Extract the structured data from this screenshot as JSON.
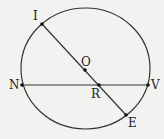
{
  "diagram": {
    "type": "circle-geometry",
    "stroke_color": "#333333",
    "background": "#f2f2f0",
    "circle": {
      "cx": 85.5,
      "cy": 68.5,
      "rx": 64.5,
      "ry": 60.5
    },
    "points": [
      {
        "id": "I",
        "label": "I",
        "x": 42,
        "y": 24,
        "lx": 33,
        "ly": 20
      },
      {
        "id": "O",
        "label": "O",
        "x": 85,
        "y": 70,
        "lx": 81,
        "ly": 66
      },
      {
        "id": "N",
        "label": "N",
        "x": 22,
        "y": 85,
        "lx": 9,
        "ly": 89
      },
      {
        "id": "V",
        "label": "V",
        "x": 148,
        "y": 85,
        "lx": 151,
        "ly": 89
      },
      {
        "id": "R",
        "label": "R",
        "x": 99,
        "y": 85,
        "lx": 91,
        "ly": 98
      },
      {
        "id": "E",
        "label": "E",
        "x": 126,
        "y": 115,
        "lx": 128,
        "ly": 127
      }
    ],
    "segments": [
      {
        "from": "I",
        "to": "E",
        "name": "diameter-IE"
      },
      {
        "from": "N",
        "to": "V",
        "name": "chord-NV"
      }
    ]
  }
}
